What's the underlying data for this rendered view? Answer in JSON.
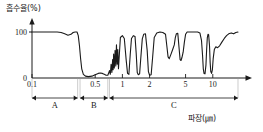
{
  "chart_data": {
    "type": "line",
    "title": "",
    "ylabel": "흡수율(%)",
    "xlabel": "파장(㎛)",
    "x_scale": "log",
    "xlim": [
      0.1,
      20
    ],
    "ylim": [
      0,
      115
    ],
    "y_ticks": [
      {
        "value": 0,
        "label": "0"
      },
      {
        "value": 100,
        "label": "100"
      }
    ],
    "x_ticks": [
      {
        "value": 0.1,
        "label": "0.1"
      },
      {
        "value": 0.5,
        "label": "0.5"
      },
      {
        "value": 1,
        "label": "1"
      },
      {
        "value": 2,
        "label": "2"
      },
      {
        "value": 5,
        "label": "5"
      },
      {
        "value": 10,
        "label": "10"
      }
    ],
    "grid": false,
    "legend": null,
    "series": [
      {
        "name": "atmospheric-absorption",
        "color": "#1a1a1a",
        "points": [
          [
            0.1,
            100
          ],
          [
            0.13,
            100
          ],
          [
            0.16,
            100
          ],
          [
            0.19,
            100
          ],
          [
            0.21,
            99
          ],
          [
            0.23,
            96
          ],
          [
            0.25,
            93
          ],
          [
            0.27,
            95
          ],
          [
            0.285,
            99
          ],
          [
            0.3,
            100
          ],
          [
            0.315,
            100
          ],
          [
            0.325,
            92
          ],
          [
            0.335,
            70
          ],
          [
            0.345,
            42
          ],
          [
            0.355,
            20
          ],
          [
            0.37,
            8
          ],
          [
            0.39,
            4
          ],
          [
            0.42,
            3
          ],
          [
            0.46,
            4
          ],
          [
            0.5,
            7
          ],
          [
            0.54,
            10
          ],
          [
            0.57,
            11
          ],
          [
            0.6,
            10
          ],
          [
            0.63,
            8
          ],
          [
            0.66,
            6
          ],
          [
            0.69,
            6
          ],
          [
            0.72,
            16
          ],
          [
            0.735,
            8
          ],
          [
            0.75,
            30
          ],
          [
            0.765,
            12
          ],
          [
            0.78,
            40
          ],
          [
            0.79,
            18
          ],
          [
            0.8,
            52
          ],
          [
            0.815,
            22
          ],
          [
            0.83,
            60
          ],
          [
            0.845,
            26
          ],
          [
            0.86,
            72
          ],
          [
            0.875,
            30
          ],
          [
            0.89,
            62
          ],
          [
            0.905,
            20
          ],
          [
            0.95,
            88
          ],
          [
            1.0,
            92
          ],
          [
            1.05,
            86
          ],
          [
            1.1,
            40
          ],
          [
            1.14,
            10
          ],
          [
            1.18,
            8
          ],
          [
            1.22,
            50
          ],
          [
            1.26,
            86
          ],
          [
            1.32,
            92
          ],
          [
            1.38,
            90
          ],
          [
            1.42,
            55
          ],
          [
            1.46,
            12
          ],
          [
            1.5,
            7
          ],
          [
            1.55,
            9
          ],
          [
            1.6,
            45
          ],
          [
            1.66,
            85
          ],
          [
            1.72,
            95
          ],
          [
            1.8,
            96
          ],
          [
            1.88,
            60
          ],
          [
            1.94,
            14
          ],
          [
            2.0,
            6
          ],
          [
            2.08,
            7
          ],
          [
            2.16,
            45
          ],
          [
            2.25,
            88
          ],
          [
            2.4,
            98
          ],
          [
            2.6,
            100
          ],
          [
            2.8,
            99
          ],
          [
            3.0,
            95
          ],
          [
            3.1,
            70
          ],
          [
            3.2,
            46
          ],
          [
            3.3,
            42
          ],
          [
            3.45,
            52
          ],
          [
            3.6,
            62
          ],
          [
            3.75,
            72
          ],
          [
            3.85,
            88
          ],
          [
            3.95,
            96
          ],
          [
            4.1,
            97
          ],
          [
            4.25,
            62
          ],
          [
            4.35,
            40
          ],
          [
            4.45,
            38
          ],
          [
            4.55,
            44
          ],
          [
            4.7,
            56
          ],
          [
            4.85,
            78
          ],
          [
            5.0,
            95
          ],
          [
            5.2,
            100
          ],
          [
            5.5,
            100
          ],
          [
            5.9,
            100
          ],
          [
            6.3,
            100
          ],
          [
            6.8,
            100
          ],
          [
            7.2,
            98
          ],
          [
            7.5,
            82
          ],
          [
            7.7,
            50
          ],
          [
            7.85,
            20
          ],
          [
            8.0,
            10
          ],
          [
            8.2,
            9
          ],
          [
            8.4,
            28
          ],
          [
            8.55,
            62
          ],
          [
            8.7,
            88
          ],
          [
            8.85,
            95
          ],
          [
            9.0,
            94
          ],
          [
            9.2,
            70
          ],
          [
            9.35,
            34
          ],
          [
            9.5,
            14
          ],
          [
            9.7,
            10
          ],
          [
            9.9,
            18
          ],
          [
            10.1,
            42
          ],
          [
            10.4,
            62
          ],
          [
            10.8,
            68
          ],
          [
            11.3,
            66
          ],
          [
            11.9,
            70
          ],
          [
            12.6,
            78
          ],
          [
            13.4,
            86
          ],
          [
            14.2,
            92
          ],
          [
            15.0,
            96
          ],
          [
            16.0,
            98
          ],
          [
            17.0,
            96
          ],
          [
            18.0,
            99
          ],
          [
            19.0,
            100
          ]
        ]
      }
    ],
    "region_spans": [
      {
        "id": "A",
        "label": "A",
        "from": 0.1,
        "to": 0.32
      },
      {
        "id": "B",
        "label": "B",
        "from": 0.34,
        "to": 0.69
      },
      {
        "id": "C",
        "label": "C",
        "from": 0.72,
        "to": 19.0
      }
    ]
  }
}
